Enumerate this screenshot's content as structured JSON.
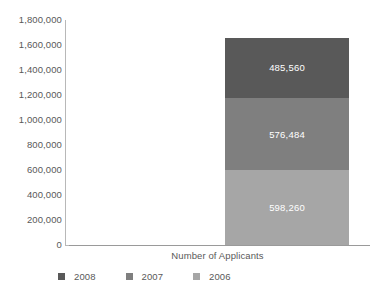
{
  "chart_data": {
    "type": "bar",
    "subtype": "stacked-single-category",
    "title": "",
    "xlabel": "Number of Applicants",
    "ylabel": "",
    "categories": [
      "Number of Applicants"
    ],
    "ylim": [
      0,
      1800000
    ],
    "ytick_step": 200000,
    "ytick_labels": [
      "1,800,000",
      "1,600,000",
      "1,400,000",
      "1,200,000",
      "1,000,000",
      "800,000",
      "600,000",
      "400,000",
      "200,000",
      "0"
    ],
    "ytick_values": [
      1800000,
      1600000,
      1400000,
      1200000,
      1000000,
      800000,
      600000,
      400000,
      200000,
      0
    ],
    "grid": false,
    "legend_position": "bottom",
    "stack_order_bottom_to_top": [
      "2006",
      "2007",
      "2008"
    ],
    "total": 1660304,
    "series": [
      {
        "name": "2008",
        "values": [
          485560
        ],
        "label": "485,560",
        "color": "#595959"
      },
      {
        "name": "2007",
        "values": [
          576484
        ],
        "label": "576,484",
        "color": "#7f7f7f"
      },
      {
        "name": "2006",
        "values": [
          598260
        ],
        "label": "598,260",
        "color": "#a6a6a6"
      }
    ],
    "legend": [
      {
        "label": "2008",
        "color": "#595959"
      },
      {
        "label": "2007",
        "color": "#7f7f7f"
      },
      {
        "label": "2006",
        "color": "#a6a6a6"
      }
    ],
    "axis_color": "#b8b8b8",
    "text_color": "#595959",
    "data_label_color": "#ffffff",
    "background": "#ffffff"
  }
}
